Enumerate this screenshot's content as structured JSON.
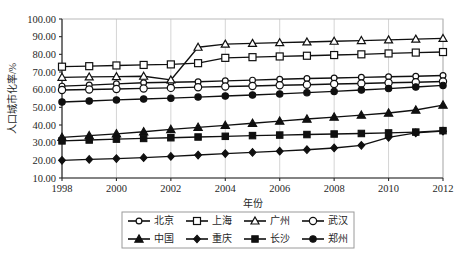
{
  "chart_data": {
    "type": "line",
    "title": "",
    "xlabel": "年份",
    "ylabel": "人口城市化率/%",
    "x": [
      1998,
      1999,
      2000,
      2001,
      2002,
      2003,
      2004,
      2005,
      2006,
      2007,
      2008,
      2009,
      2010,
      2011,
      2012
    ],
    "xlim": [
      1998,
      2012
    ],
    "ylim": [
      10.0,
      100.0
    ],
    "xticks": [
      "1998",
      "2000",
      "2002",
      "2004",
      "2006",
      "2008",
      "2010",
      "2012"
    ],
    "xtick_values": [
      1998,
      2000,
      2002,
      2004,
      2006,
      2008,
      2010,
      2012
    ],
    "yticks": [
      "10.00",
      "20.00",
      "30.00",
      "40.00",
      "50.00",
      "60.00",
      "70.00",
      "80.00",
      "90.00",
      "100.00"
    ],
    "ytick_values": [
      10,
      20,
      30,
      40,
      50,
      60,
      70,
      80,
      90,
      100
    ],
    "grid": "vertical",
    "legend_position": "bottom",
    "legend_columns": 4,
    "series": [
      {
        "name": "北京",
        "marker": "circle-hollow",
        "values": [
          62.0,
          62.6,
          63.3,
          63.9,
          64.2,
          64.5,
          65.0,
          65.4,
          65.9,
          66.3,
          66.6,
          67.0,
          67.3,
          67.6,
          68.0
        ]
      },
      {
        "name": "上海",
        "marker": "square-hollow",
        "values": [
          73.0,
          73.3,
          73.7,
          74.0,
          74.3,
          75.0,
          78.0,
          78.4,
          78.8,
          79.2,
          79.6,
          80.0,
          80.5,
          81.0,
          81.3
        ]
      },
      {
        "name": "广州",
        "marker": "triangle-hollow",
        "values": [
          67.0,
          67.2,
          67.4,
          67.6,
          65.5,
          84.0,
          85.8,
          86.2,
          86.6,
          87.0,
          87.4,
          87.8,
          88.2,
          88.6,
          89.0
        ]
      },
      {
        "name": "武汉",
        "marker": "circle-hollow-large",
        "values": [
          59.8,
          60.1,
          60.4,
          60.7,
          61.0,
          61.4,
          61.8,
          62.1,
          62.5,
          62.8,
          63.2,
          63.5,
          63.9,
          64.2,
          64.6
        ]
      },
      {
        "name": "中国",
        "marker": "triangle-solid",
        "values": [
          33.0,
          34.0,
          35.0,
          36.2,
          37.5,
          38.7,
          39.8,
          41.0,
          42.2,
          43.4,
          44.5,
          45.6,
          46.8,
          48.5,
          51.3
        ]
      },
      {
        "name": "重庆",
        "marker": "diamond-solid",
        "values": [
          20.0,
          20.5,
          21.0,
          21.5,
          22.2,
          23.0,
          23.8,
          24.5,
          25.2,
          26.0,
          27.0,
          28.5,
          33.0,
          35.5,
          36.5
        ]
      },
      {
        "name": "长沙",
        "marker": "square-solid",
        "values": [
          31.0,
          31.5,
          32.0,
          32.4,
          32.8,
          33.2,
          33.6,
          34.0,
          34.3,
          34.6,
          34.9,
          35.2,
          35.5,
          36.0,
          36.8
        ]
      },
      {
        "name": "郑州",
        "marker": "circle-solid",
        "values": [
          53.0,
          53.6,
          54.2,
          54.7,
          55.2,
          55.8,
          56.4,
          57.0,
          57.6,
          58.3,
          59.0,
          59.8,
          60.6,
          61.5,
          62.4
        ]
      }
    ]
  },
  "legend": {
    "entries": [
      {
        "label": "北京",
        "marker": "circle-hollow"
      },
      {
        "label": "上海",
        "marker": "square-hollow"
      },
      {
        "label": "广州",
        "marker": "triangle-hollow"
      },
      {
        "label": "武汉",
        "marker": "circle-hollow-large"
      },
      {
        "label": "中国",
        "marker": "triangle-solid"
      },
      {
        "label": "重庆",
        "marker": "diamond-solid"
      },
      {
        "label": "长沙",
        "marker": "square-solid"
      },
      {
        "label": "郑州",
        "marker": "circle-solid"
      }
    ]
  },
  "colors": {
    "line": "#101010",
    "grid": "#d4d4d4",
    "frame": "#b9b9b9",
    "text": "#1f1f1f",
    "background": "#ffffff"
  }
}
